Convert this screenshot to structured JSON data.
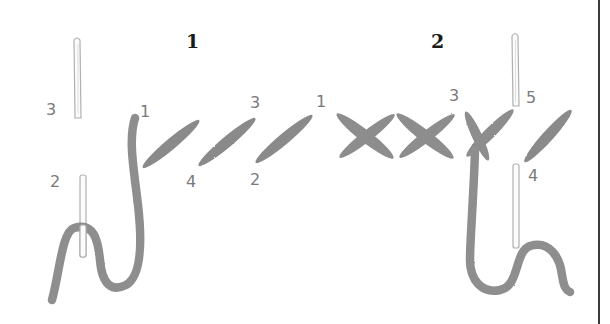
{
  "diagram": {
    "colors": {
      "background": "#ffffff",
      "thread": "#8c8c8c",
      "thread_dark": "#7a7a7a",
      "needle_outline": "#b5b5b5",
      "label": "#7a7a7a",
      "step_number": "#1a1a1a",
      "rule": "#3a3a3a"
    },
    "steps": [
      {
        "number": "1",
        "labels": {
          "needle_top": "3",
          "needle_bottom": "2",
          "thread_start": "1",
          "stitch_a_bottom": "4",
          "stitch_b_top": "3",
          "stitch_b_bottom": "2",
          "stitch_c_top": "1"
        }
      },
      {
        "number": "2",
        "labels": {
          "cross_start": "1",
          "cross_top": "3",
          "needle_top": "5",
          "needle_bottom": "4"
        }
      }
    ]
  }
}
